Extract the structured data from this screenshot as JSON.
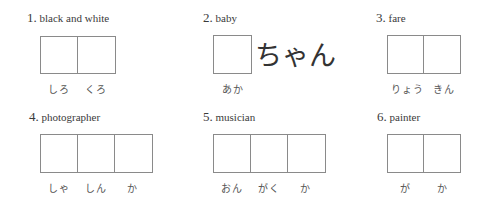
{
  "items": [
    {
      "number": "1.",
      "label": "black and white",
      "box_count": 2,
      "readings": [
        "しろ",
        "くろ"
      ],
      "suffix": ""
    },
    {
      "number": "2.",
      "label": "baby",
      "box_count": 1,
      "readings": [
        "あか"
      ],
      "suffix": "ちゃん"
    },
    {
      "number": "3.",
      "label": "fare",
      "box_count": 2,
      "readings": [
        "りょう",
        "きん"
      ],
      "suffix": ""
    },
    {
      "number": "4.",
      "label": "photographer",
      "box_count": 3,
      "readings": [
        "しゃ",
        "しん",
        "か"
      ],
      "suffix": ""
    },
    {
      "number": "5.",
      "label": "musician",
      "box_count": 3,
      "readings": [
        "おん",
        "がく",
        "か"
      ],
      "suffix": ""
    },
    {
      "number": "6.",
      "label": "painter",
      "box_count": 2,
      "readings": [
        "が",
        "か"
      ],
      "suffix": ""
    }
  ]
}
